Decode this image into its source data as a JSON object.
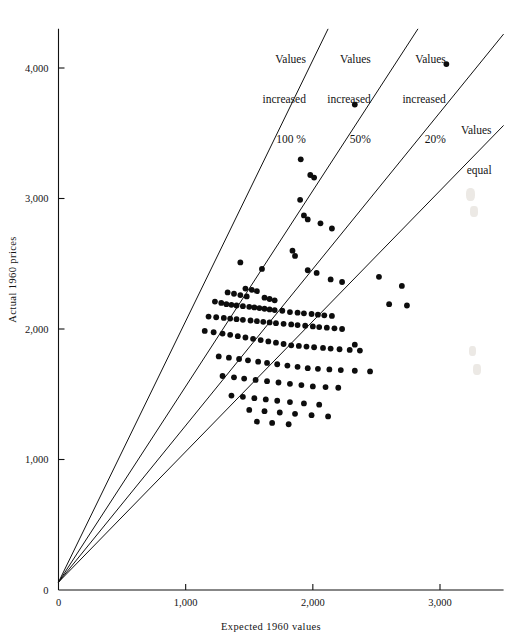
{
  "figure": {
    "background": "#ffffff",
    "ink_color": "#111111"
  },
  "chart_data": {
    "type": "scatter",
    "title": "",
    "subtitle": "",
    "xlabel": "Expected 1960 values",
    "ylabel": "Actual 1960 prices",
    "xlim": [
      0,
      3500
    ],
    "ylim": [
      0,
      4300
    ],
    "xticks": [
      0,
      1000,
      2000,
      3000
    ],
    "xticklabels": [
      "0",
      "1,000",
      "2,000",
      "3,000"
    ],
    "yticks": [
      0,
      1000,
      2000,
      3000,
      4000
    ],
    "yticklabels": [
      "0",
      "1,000",
      "2,000",
      "3,000",
      "4,000"
    ],
    "grid": false,
    "legend_position": "none",
    "marker": "filled-circle",
    "marker_color": "#0d0d0d",
    "reference_lines": [
      {
        "name": "values-increased-100",
        "label": "Values\nincreased\n100 %",
        "slope": 2.0,
        "intercept": 60,
        "label_anchor_x": 1930,
        "label_anchor_y": 4320
      },
      {
        "name": "values-increased-50",
        "label": "Values\nincreased\n50%",
        "slope": 1.5,
        "intercept": 60,
        "label_anchor_x": 2440,
        "label_anchor_y": 4320
      },
      {
        "name": "values-increased-20",
        "label": "Values\nincreased\n20%",
        "slope": 1.2,
        "intercept": 60,
        "label_anchor_x": 3030,
        "label_anchor_y": 4320
      },
      {
        "name": "values-equal",
        "label": "Values\nequal",
        "slope": 1.0,
        "intercept": 60,
        "label_anchor_x": 3390,
        "label_anchor_y": 3780
      }
    ],
    "x": [
      3050,
      2330,
      1905,
      1980,
      2010,
      1900,
      1930,
      1960,
      2060,
      2150,
      1840,
      1860,
      1430,
      1600,
      1960,
      2030,
      2520,
      2140,
      2230,
      2700,
      1470,
      1520,
      1560,
      1330,
      1380,
      1430,
      1480,
      1620,
      1660,
      1700,
      1230,
      1280,
      1320,
      1360,
      1400,
      1450,
      1500,
      1540,
      1580,
      1620,
      1660,
      1700,
      1760,
      1820,
      1880,
      1930,
      1990,
      2040,
      2090,
      2150,
      1180,
      1240,
      1300,
      1350,
      1400,
      1450,
      1510,
      1560,
      1610,
      1660,
      1710,
      1770,
      1830,
      1880,
      1940,
      2000,
      2050,
      2110,
      2170,
      2230,
      1150,
      1220,
      1290,
      1350,
      1410,
      1470,
      1530,
      1590,
      1650,
      1710,
      1770,
      1830,
      1890,
      1950,
      2010,
      2080,
      2140,
      2210,
      2290,
      2370,
      1260,
      1340,
      1420,
      1490,
      1570,
      1640,
      1720,
      1800,
      1880,
      1960,
      2040,
      2130,
      2220,
      2330,
      2450,
      2600,
      2740,
      1290,
      1380,
      1460,
      1550,
      1640,
      1730,
      1820,
      1910,
      2000,
      2100,
      2200,
      1360,
      1450,
      1540,
      1630,
      1720,
      1820,
      1930,
      2050,
      1500,
      1620,
      1740,
      1860,
      1990,
      2120,
      1560,
      1680,
      1810,
      2330
    ],
    "y": [
      4030,
      3720,
      3300,
      3180,
      3160,
      2990,
      2870,
      2840,
      2810,
      2770,
      2600,
      2560,
      2510,
      2460,
      2450,
      2430,
      2400,
      2380,
      2360,
      2330,
      2310,
      2300,
      2290,
      2280,
      2270,
      2260,
      2250,
      2240,
      2230,
      2220,
      2210,
      2200,
      2190,
      2185,
      2180,
      2175,
      2170,
      2165,
      2160,
      2155,
      2150,
      2145,
      2140,
      2130,
      2125,
      2120,
      2115,
      2110,
      2105,
      2100,
      2095,
      2090,
      2085,
      2080,
      2075,
      2070,
      2065,
      2060,
      2055,
      2050,
      2045,
      2040,
      2035,
      2030,
      2025,
      2020,
      2015,
      2010,
      2005,
      2000,
      1985,
      1975,
      1965,
      1955,
      1945,
      1935,
      1925,
      1915,
      1905,
      1895,
      1885,
      1875,
      1870,
      1865,
      1860,
      1855,
      1850,
      1845,
      1840,
      1835,
      1790,
      1780,
      1770,
      1760,
      1750,
      1740,
      1730,
      1720,
      1710,
      1700,
      1695,
      1690,
      1685,
      1680,
      1675,
      2190,
      2180,
      1640,
      1630,
      1620,
      1610,
      1600,
      1590,
      1580,
      1570,
      1560,
      1555,
      1550,
      1490,
      1480,
      1470,
      1460,
      1450,
      1440,
      1430,
      1420,
      1380,
      1370,
      1360,
      1350,
      1340,
      1330,
      1290,
      1280,
      1270,
      1880
    ]
  },
  "annotations": {
    "inc100": {
      "line1": "Values",
      "line2": "increased",
      "line3": "100 %"
    },
    "inc50": {
      "line1": "Values",
      "line2": "increased",
      "line3": "50%"
    },
    "inc20": {
      "line1": "Values",
      "line2": "increased",
      "line3": "20%"
    },
    "equal": {
      "line1": "Values",
      "line2": "equal"
    }
  }
}
